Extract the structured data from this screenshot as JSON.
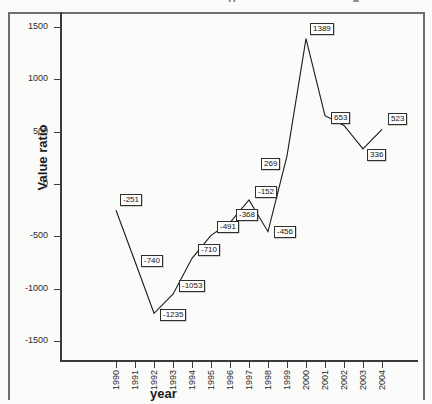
{
  "figure": {
    "y_axis_title": "Value ratio",
    "x_axis_title": "year",
    "title_remnant_left": "μ",
    "title_remnant_right": "●"
  },
  "chart_data": {
    "type": "line",
    "title": "",
    "xlabel": "year",
    "ylabel": "Value ratio",
    "categories": [
      "1990",
      "1991",
      "1992",
      "1993",
      "1994",
      "1995",
      "1996",
      "1997",
      "1998",
      "1999",
      "2000",
      "2001",
      "2002",
      "2003",
      "2004"
    ],
    "values": [
      -251,
      -740,
      -1235,
      -1053,
      -710,
      -491,
      -368,
      -152,
      -456,
      269,
      1389,
      653,
      null,
      336,
      523
    ],
    "point_labels": [
      "-251",
      "-740",
      "-1235",
      "-1053",
      "-710",
      "-491",
      "-368",
      "-152",
      "-456",
      "269",
      "1389",
      "653",
      "",
      "336",
      "523"
    ],
    "yticks": [
      1500,
      1000,
      500,
      0,
      -500,
      -1000,
      -1500
    ],
    "ytick_labels": [
      "1500",
      "1000",
      "500",
      "0",
      "-500",
      "-1000",
      "-1500"
    ],
    "ylim": [
      -1600,
      1600
    ],
    "grid": false,
    "legend": "none",
    "line_color": "#1a1a1a",
    "marker": "none",
    "unlabeled_points": [
      {
        "category": "2002",
        "approx_value": 560
      }
    ]
  }
}
